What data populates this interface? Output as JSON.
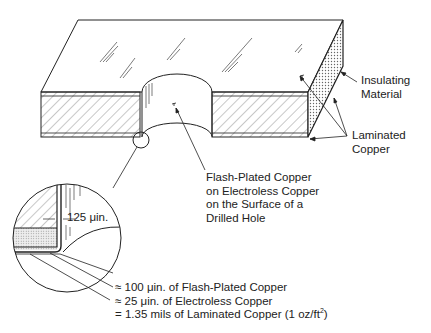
{
  "diagram": {
    "type": "cross-section illustration",
    "labels": {
      "insulating_material": [
        "Insulating",
        "Material"
      ],
      "laminated_copper": [
        "Laminated",
        "Copper"
      ],
      "hole_surface": [
        "Flash-Plated Copper",
        "on Electroless Copper",
        "on the Surface of a",
        "Drilled Hole"
      ],
      "dimension": "125 μin."
    },
    "legend": [
      {
        "prefix": "≈",
        "text": "100 μin. of Flash-Plated Copper"
      },
      {
        "prefix": "≈",
        "text": "25 μin. of Electroless Copper"
      },
      {
        "prefix": "=",
        "text": "1.35 mils of Laminated Copper (1 oz/ft",
        "sup": "2",
        "suffix": ")"
      }
    ],
    "colors": {
      "line": "#222222",
      "background": "#ffffff"
    }
  }
}
